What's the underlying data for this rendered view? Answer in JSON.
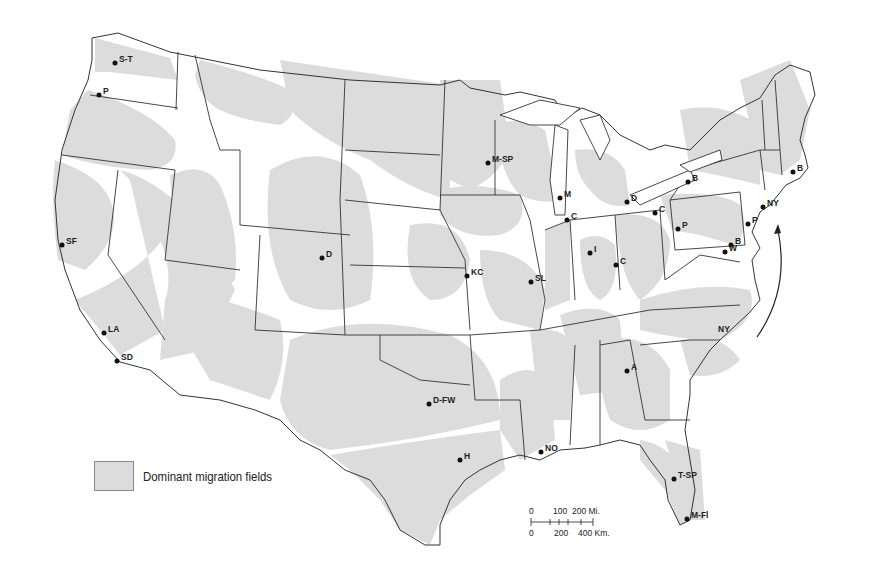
{
  "legend": {
    "swatch_color": "#dcdcdc",
    "label": "Dominant migration fields"
  },
  "scale_bar": {
    "miles_ticks": [
      "0",
      "100",
      "200 Mi."
    ],
    "km_ticks": [
      "0",
      "200",
      "400 Km."
    ]
  },
  "cities": [
    {
      "label": "S-T",
      "x": 115,
      "y": 63
    },
    {
      "label": "P",
      "x": 99,
      "y": 95
    },
    {
      "label": "SF",
      "x": 62,
      "y": 245
    },
    {
      "label": "LA",
      "x": 104,
      "y": 333
    },
    {
      "label": "SD",
      "x": 117,
      "y": 361
    },
    {
      "label": "D",
      "x": 322,
      "y": 258
    },
    {
      "label": "M-SP",
      "x": 488,
      "y": 163
    },
    {
      "label": "M",
      "x": 560,
      "y": 198
    },
    {
      "label": "D",
      "x": 627,
      "y": 202
    },
    {
      "label": "C",
      "x": 567,
      "y": 220
    },
    {
      "label": "C",
      "x": 655,
      "y": 213
    },
    {
      "label": "B",
      "x": 688,
      "y": 182
    },
    {
      "label": "B",
      "x": 793,
      "y": 172
    },
    {
      "label": "NY",
      "x": 763,
      "y": 207
    },
    {
      "label": "P",
      "x": 678,
      "y": 229
    },
    {
      "label": "P",
      "x": 748,
      "y": 224
    },
    {
      "label": "B",
      "x": 731,
      "y": 245
    },
    {
      "label": "W",
      "x": 725,
      "y": 252
    },
    {
      "label": "KC",
      "x": 467,
      "y": 276
    },
    {
      "label": "I",
      "x": 590,
      "y": 253
    },
    {
      "label": "C",
      "x": 616,
      "y": 265
    },
    {
      "label": "SL",
      "x": 531,
      "y": 282
    },
    {
      "label": "A",
      "x": 627,
      "y": 371
    },
    {
      "label": "D-FW",
      "x": 429,
      "y": 404
    },
    {
      "label": "H",
      "x": 460,
      "y": 460
    },
    {
      "label": "NO",
      "x": 541,
      "y": 452
    },
    {
      "label": "T-SP",
      "x": 674,
      "y": 479
    },
    {
      "label": "M-Fl",
      "x": 687,
      "y": 519
    }
  ],
  "annotations": [
    {
      "label": "NY",
      "x": 718,
      "y": 332
    }
  ]
}
